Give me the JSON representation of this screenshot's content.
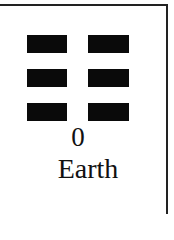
{
  "card": {
    "number": "0",
    "name": "Earth",
    "lines": [
      {
        "type": "broken"
      },
      {
        "type": "broken"
      },
      {
        "type": "broken"
      }
    ],
    "colors": {
      "bar": "#0a0a0a",
      "border": "#222222",
      "text": "#111111",
      "background": "#ffffff"
    }
  }
}
